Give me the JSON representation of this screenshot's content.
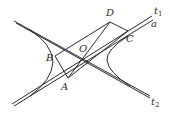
{
  "figure": {
    "type": "hyperbola-with-asymptotes",
    "points": {
      "A": {
        "label": "A",
        "x": 68,
        "y": 78
      },
      "B": {
        "label": "B",
        "x": 55,
        "y": 56
      },
      "C": {
        "label": "C",
        "x": 128,
        "y": 31
      },
      "D": {
        "label": "D",
        "x": 110,
        "y": 22
      },
      "O": {
        "label": "O",
        "x": 83,
        "y": 58
      }
    },
    "lines": {
      "t1": {
        "label": "t",
        "sub": "1"
      },
      "t2": {
        "label": "t",
        "sub": "2"
      },
      "a": {
        "label": "a"
      }
    },
    "stroke_color": "#2a2a2a"
  }
}
